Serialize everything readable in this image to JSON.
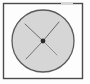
{
  "figure": {
    "caption": "",
    "background_color": "#fdfdfd",
    "canvas": {
      "width": 90,
      "height": 84
    },
    "frame": {
      "name": "figure-border",
      "x": 3.5,
      "y": 3.5,
      "width": 79,
      "height": 75,
      "stroke_color": "#4a4a4a",
      "stroke_width": 1.4,
      "fill": "none",
      "gap": {
        "present": true,
        "edge": "top",
        "x_start": 61,
        "x_end": 73,
        "stroke_color": "#d8d8d8"
      }
    },
    "circle": {
      "name": "shaded-circle",
      "center_x": 43,
      "center_y": 41,
      "radius": 31,
      "fill_color": "#d6d6d6",
      "stroke_color": "#5a5a5a",
      "stroke_width": 1.3
    },
    "cross": {
      "name": "center-cross",
      "center_x": 43,
      "center_y": 41,
      "stroke_color": "#5a5a5a",
      "stroke_width": 1.0,
      "rays": [
        {
          "name": "ray-upper-left",
          "x1": 43,
          "y1": 41,
          "x2": 25,
          "y2": 24,
          "opacity": 0.85
        },
        {
          "name": "ray-upper-right",
          "x1": 43,
          "y1": 41,
          "x2": 59,
          "y2": 22,
          "opacity": 0.9
        },
        {
          "name": "ray-lower-left",
          "x1": 43,
          "y1": 41,
          "x2": 26,
          "y2": 59,
          "opacity": 0.8
        },
        {
          "name": "ray-lower-right",
          "x1": 43,
          "y1": 41,
          "x2": 57,
          "y2": 55,
          "opacity": 0.55
        }
      ]
    },
    "center_dot": {
      "name": "center-point",
      "cx": 43,
      "cy": 41,
      "r": 2.4,
      "fill_color": "#2b2b2b"
    }
  }
}
